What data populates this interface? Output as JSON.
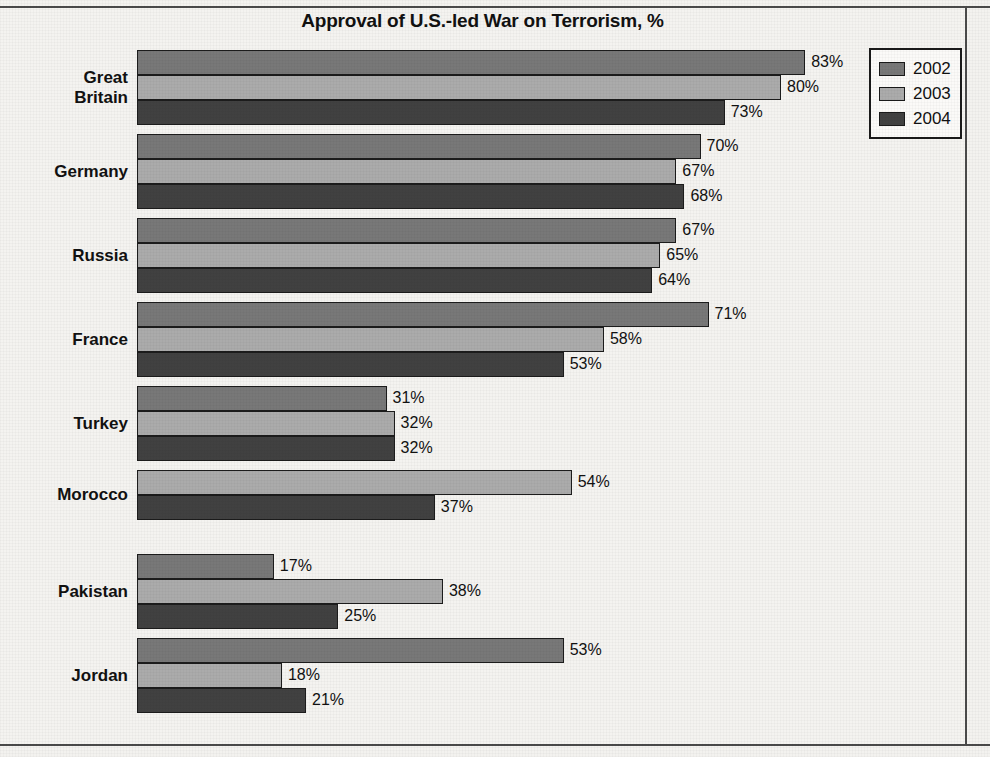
{
  "chart_data": {
    "type": "bar",
    "orientation": "horizontal",
    "title": "Approval of U.S.-led War on Terrorism, %",
    "xlabel": "",
    "ylabel": "",
    "xlim": [
      0,
      83
    ],
    "grid": false,
    "legend_position": "top-right",
    "value_suffix": "%",
    "categories": [
      "Great Britain",
      "Germany",
      "Russia",
      "France",
      "Turkey",
      "Morocco",
      "Pakistan",
      "Jordan"
    ],
    "series": [
      {
        "name": "2002",
        "color": "#787878",
        "values": [
          83,
          70,
          67,
          71,
          31,
          null,
          17,
          53
        ]
      },
      {
        "name": "2003",
        "color": "#ababab",
        "values": [
          80,
          67,
          65,
          58,
          32,
          54,
          38,
          18
        ]
      },
      {
        "name": "2004",
        "color": "#414141",
        "values": [
          73,
          68,
          64,
          53,
          32,
          37,
          25,
          21
        ]
      }
    ],
    "data_labels": {
      "Great Britain": {
        "2002": "83%",
        "2003": "80%",
        "2004": "73%"
      },
      "Germany": {
        "2002": "70%",
        "2003": "67%",
        "2004": "68%"
      },
      "Russia": {
        "2002": "67%",
        "2003": "65%",
        "2004": "64%"
      },
      "France": {
        "2002": "71%",
        "2003": "58%",
        "2004": "53%"
      },
      "Turkey": {
        "2002": "31%",
        "2003": "32%",
        "2004": "32%"
      },
      "Morocco": {
        "2003": "54%",
        "2004": "37%"
      },
      "Pakistan": {
        "2002": "17%",
        "2003": "38%",
        "2004": "25%"
      },
      "Jordan": {
        "2002": "53%",
        "2003": "18%",
        "2004": "21%"
      }
    }
  },
  "legend": {
    "items": [
      {
        "label": "2002",
        "color": "#787878"
      },
      {
        "label": "2003",
        "color": "#ababab"
      },
      {
        "label": "2004",
        "color": "#414141"
      }
    ]
  },
  "colors": {
    "background": "#f3f2ef",
    "plot_background": "#f4f3f0",
    "frame": "#4a4a4a",
    "text": "#111111",
    "bar_outline": "#1c1c1c",
    "series_2002": "#787878",
    "series_2003": "#ababab",
    "series_2004": "#414141"
  }
}
